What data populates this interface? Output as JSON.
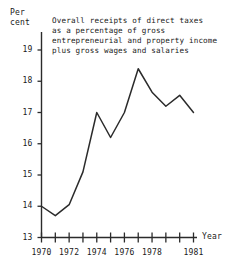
{
  "chart_data": {
    "type": "line",
    "title": "Overall receipts of direct taxes\nas a percentage of gross\nentrepreneurial and property income\nplus gross wages and salaries",
    "title_lines": [
      "Overall receipts of direct taxes",
      "as a percentage of gross",
      "entrepreneurial and property income",
      "plus gross wages and salaries"
    ],
    "xlabel": "Year",
    "ylabel": "Per\ncent",
    "ylabel_lines": [
      "Per",
      "cent"
    ],
    "x": [
      1970,
      1971,
      1972,
      1973,
      1974,
      1975,
      1976,
      1977,
      1978,
      1979,
      1980,
      1981
    ],
    "values": [
      14.0,
      13.7,
      14.05,
      15.1,
      17.0,
      16.2,
      17.0,
      18.4,
      17.65,
      17.2,
      17.55,
      17.0
    ],
    "ylim": [
      13,
      19.6
    ],
    "xlim": [
      1970,
      1981
    ],
    "yticks": [
      13,
      14,
      15,
      16,
      17,
      18,
      19
    ],
    "ytick_labels": [
      "13",
      "14",
      "15",
      "16",
      "17",
      "18",
      "19"
    ],
    "xticks": [
      1970,
      1971,
      1972,
      1973,
      1974,
      1975,
      1976,
      1977,
      1978,
      1979,
      1980,
      1981
    ],
    "xtick_labels_shown": [
      {
        "year": 1970,
        "label": "1970"
      },
      {
        "year": 1972,
        "label": "1972"
      },
      {
        "year": 1974,
        "label": "1974"
      },
      {
        "year": 1976,
        "label": "1976"
      },
      {
        "year": 1978,
        "label": "1978"
      },
      {
        "year": 1981,
        "label": "1981"
      }
    ],
    "grid": false,
    "legend": false,
    "line_color": "#2b2b2b",
    "axis_color": "#2b2b2b",
    "background_color": "#ffffff"
  }
}
